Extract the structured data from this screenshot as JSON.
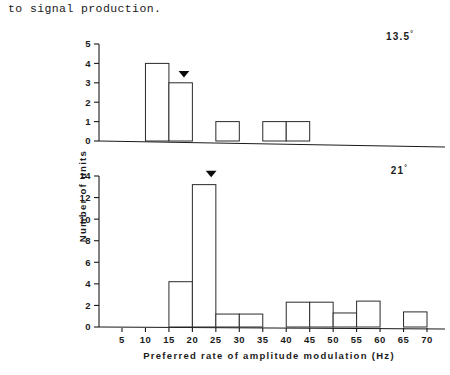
{
  "caption": {
    "text": "to signal production."
  },
  "figure": {
    "yaxis_title": "Number of units",
    "xaxis_title": "Preferred rate of amplitude modulation (Hz)",
    "x_tick_labels": [
      "5",
      "10",
      "15",
      "20",
      "25",
      "30",
      "35",
      "40",
      "45",
      "50",
      "55",
      "60",
      "65",
      "70"
    ],
    "marker_icon": "down-triangle-marker"
  },
  "chart_data": [
    {
      "type": "bar",
      "title": "13.5",
      "panel_label": "13.5°",
      "degree_symbol": "°",
      "xlabel": "Preferred rate of amplitude modulation (Hz)",
      "ylabel": "Number of units",
      "xlim": [
        0,
        70
      ],
      "ylim": [
        0,
        5
      ],
      "y_tick_labels": [
        "0",
        "1",
        "2",
        "3",
        "4",
        "5"
      ],
      "y_ticks": [
        0,
        1,
        2,
        3,
        4,
        5
      ],
      "x_ticks": [
        5,
        10,
        15,
        20,
        25,
        30,
        35,
        40,
        45,
        50,
        55,
        60,
        65,
        70
      ],
      "grid": false,
      "legend": "none",
      "bin_width": 5,
      "bins": [
        {
          "x0": 10,
          "x1": 15,
          "value": 4
        },
        {
          "x0": 15,
          "x1": 20,
          "value": 3
        },
        {
          "x0": 25,
          "x1": 30,
          "value": 1
        },
        {
          "x0": 35,
          "x1": 40,
          "value": 1
        },
        {
          "x0": 40,
          "x1": 45,
          "value": 1
        }
      ],
      "categories": [
        "10-15",
        "15-20",
        "25-30",
        "35-40",
        "40-45"
      ],
      "values": [
        4,
        3,
        1,
        1,
        1
      ],
      "annotations": [
        {
          "type": "down-triangle-marker",
          "x": 18.2,
          "y": 3.45
        }
      ]
    },
    {
      "type": "bar",
      "title": "21",
      "panel_label": "21°",
      "degree_symbol": "°",
      "xlabel": "Preferred rate of amplitude modulation (Hz)",
      "ylabel": "Number of units",
      "xlim": [
        0,
        70
      ],
      "ylim": [
        0,
        14
      ],
      "y_tick_labels": [
        "0",
        "2",
        "4",
        "6",
        "8",
        "10",
        "12",
        "14"
      ],
      "y_ticks": [
        0,
        2,
        4,
        6,
        8,
        10,
        12,
        14
      ],
      "x_ticks": [
        5,
        10,
        15,
        20,
        25,
        30,
        35,
        40,
        45,
        50,
        55,
        60,
        65,
        70
      ],
      "grid": false,
      "legend": "none",
      "bin_width": 5,
      "bins": [
        {
          "x0": 15,
          "x1": 20,
          "value": 4.2
        },
        {
          "x0": 20,
          "x1": 25,
          "value": 13.2
        },
        {
          "x0": 25,
          "x1": 30,
          "value": 1.2
        },
        {
          "x0": 30,
          "x1": 35,
          "value": 1.2
        },
        {
          "x0": 40,
          "x1": 45,
          "value": 2.3
        },
        {
          "x0": 45,
          "x1": 50,
          "value": 2.3
        },
        {
          "x0": 50,
          "x1": 55,
          "value": 1.3
        },
        {
          "x0": 55,
          "x1": 60,
          "value": 2.4
        },
        {
          "x0": 65,
          "x1": 70,
          "value": 1.4
        }
      ],
      "categories": [
        "15-20",
        "20-25",
        "25-30",
        "30-35",
        "40-45",
        "45-50",
        "50-55",
        "55-60",
        "65-70"
      ],
      "values": [
        4.2,
        13.2,
        1.2,
        1.2,
        2.3,
        2.3,
        1.3,
        2.4,
        1.4
      ],
      "annotations": [
        {
          "type": "down-triangle-marker",
          "x": 24.0,
          "y": 14.2
        }
      ]
    }
  ]
}
